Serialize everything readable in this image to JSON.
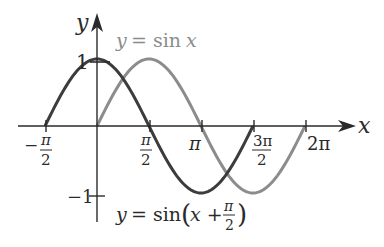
{
  "figure": {
    "axes": {
      "x_label": "x",
      "y_label": "y",
      "x_ticks": [
        {
          "num": "π",
          "den": "2",
          "sign": "−",
          "value": -1.5708
        },
        {
          "num": "π",
          "den": "2",
          "sign": "",
          "value": 1.5708
        },
        {
          "text": "π",
          "value": 3.1416
        },
        {
          "num": "3π",
          "den": "2",
          "sign": "",
          "value": 4.7124
        },
        {
          "text": "2π",
          "value": 6.2832
        }
      ],
      "y_ticks": [
        {
          "text": "1",
          "value": 1
        },
        {
          "text": "−1",
          "value": -1
        }
      ]
    },
    "curves": [
      {
        "name": "y = sin x",
        "label_prefix": "y",
        "label_eq": "= sin",
        "label_var": "x",
        "color": "#8c8c8c",
        "domain": [
          0,
          6.2832
        ]
      },
      {
        "name": "y = sin(x + π/2)",
        "label_prefix": "y",
        "label_eq": "= sin",
        "label_arg": "x +",
        "label_frac_num": "π",
        "label_frac_den": "2",
        "color": "#3c3c3c",
        "domain": [
          -1.5708,
          4.7124
        ]
      }
    ],
    "colors": {
      "axis": "#2a2a2a",
      "sin": "#8c8c8c",
      "shifted": "#3c3c3c"
    }
  }
}
